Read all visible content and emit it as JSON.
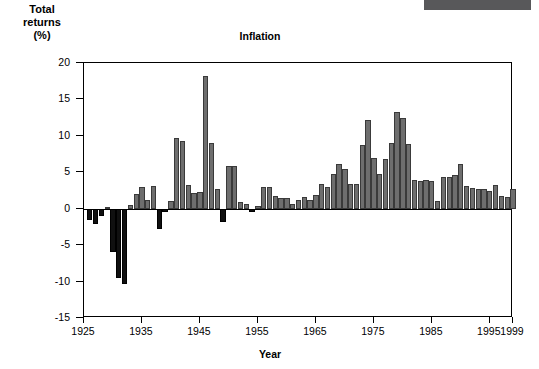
{
  "header": {
    "topbar_color": "#58585a"
  },
  "axis_titles": {
    "y_line1": "Total",
    "y_line2": "returns",
    "y_line3": "(%)",
    "x": "Year"
  },
  "chart_data": {
    "type": "bar",
    "title": "Inflation",
    "xlabel": "Year",
    "ylabel": "Total returns (%)",
    "ylim": [
      -15,
      20
    ],
    "xlim": [
      1925,
      1999
    ],
    "grid": false,
    "legend": null,
    "ytick_labels": [
      "20",
      "15",
      "10",
      "5",
      "0",
      "-5",
      "-10",
      "-15"
    ],
    "yticks": [
      20,
      15,
      10,
      5,
      0,
      -5,
      -10,
      -15
    ],
    "xtick_labels": [
      "1925",
      "1935",
      "1945",
      "1955",
      "1965",
      "1975",
      "1985",
      "1995",
      "1999"
    ],
    "xticks": [
      1925,
      1935,
      1945,
      1955,
      1965,
      1975,
      1985,
      1995,
      1999
    ],
    "positive_color": "#6e6e6e",
    "negative_color": "#101010",
    "categories": [
      1926,
      1927,
      1928,
      1929,
      1930,
      1931,
      1932,
      1933,
      1934,
      1935,
      1936,
      1937,
      1938,
      1939,
      1940,
      1941,
      1942,
      1943,
      1944,
      1945,
      1946,
      1947,
      1948,
      1949,
      1950,
      1951,
      1952,
      1953,
      1954,
      1955,
      1956,
      1957,
      1958,
      1959,
      1960,
      1961,
      1962,
      1963,
      1964,
      1965,
      1966,
      1967,
      1968,
      1969,
      1970,
      1971,
      1972,
      1973,
      1974,
      1975,
      1976,
      1977,
      1978,
      1979,
      1980,
      1981,
      1982,
      1983,
      1984,
      1985,
      1986,
      1987,
      1988,
      1989,
      1990,
      1991,
      1992,
      1993,
      1994,
      1995,
      1996,
      1997,
      1998,
      1999
    ],
    "values": [
      -1.5,
      -2.1,
      -1.0,
      0.2,
      -6.0,
      -9.5,
      -10.3,
      0.5,
      2.0,
      3.0,
      1.2,
      3.1,
      -2.8,
      -0.5,
      1.0,
      9.7,
      9.3,
      3.2,
      2.1,
      2.3,
      18.2,
      9.0,
      2.7,
      -1.8,
      5.8,
      5.9,
      0.9,
      0.6,
      -0.5,
      0.4,
      3.0,
      3.0,
      1.8,
      1.5,
      1.5,
      0.7,
      1.2,
      1.6,
      1.2,
      1.9,
      3.4,
      3.0,
      4.7,
      6.1,
      5.5,
      3.4,
      3.4,
      8.8,
      12.2,
      7.0,
      4.8,
      6.8,
      9.0,
      13.3,
      12.4,
      8.9,
      3.9,
      3.8,
      4.0,
      3.8,
      1.1,
      4.4,
      4.4,
      4.6,
      6.1,
      3.1,
      2.9,
      2.7,
      2.7,
      2.5,
      3.3,
      1.7,
      1.6,
      2.7
    ]
  }
}
